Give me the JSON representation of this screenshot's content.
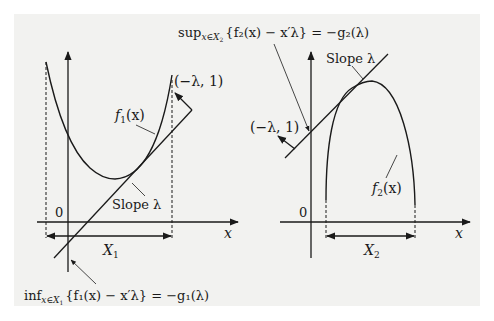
{
  "figure": {
    "left_panel": {
      "function_label": "f",
      "function_sub": "1",
      "function_arg": "(x)",
      "normal_vector_label": "(−λ, 1)",
      "slope_label": "Slope λ",
      "origin_label": "0",
      "x_axis_label": "x",
      "domain_label": "X",
      "domain_sub": "1",
      "equation": {
        "op": "inf",
        "subscript": "x∈X",
        "subscript_sub": "1",
        "body": "{f₁(x) − x′λ} = −g₁(λ)"
      }
    },
    "right_panel": {
      "function_label": "f",
      "function_sub": "2",
      "function_arg": "(x)",
      "normal_vector_label": "(−λ, 1)",
      "slope_label": "Slope λ",
      "origin_label": "0",
      "x_axis_label": "x",
      "domain_label": "X",
      "domain_sub": "2",
      "equation": {
        "op": "sup",
        "subscript": "x∈X",
        "subscript_sub": "2",
        "body": "{f₂(x) − x′λ} = −g₂(λ)"
      }
    },
    "colors": {
      "background": "#f2f2f0",
      "ink": "#1a1a1a"
    }
  }
}
